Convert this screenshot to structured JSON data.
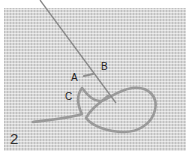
{
  "figure": {
    "step_number": "2",
    "labels": {
      "a": "A",
      "b": "B",
      "c": "C"
    },
    "elements": {
      "fabric": "woven-fabric",
      "needle": "needle",
      "thread": "thread-loop"
    },
    "colors": {
      "fabric": "#d6d6d6",
      "needle": "#8a8a8a",
      "thread": "#9a9a9a",
      "text": "#222222"
    }
  }
}
